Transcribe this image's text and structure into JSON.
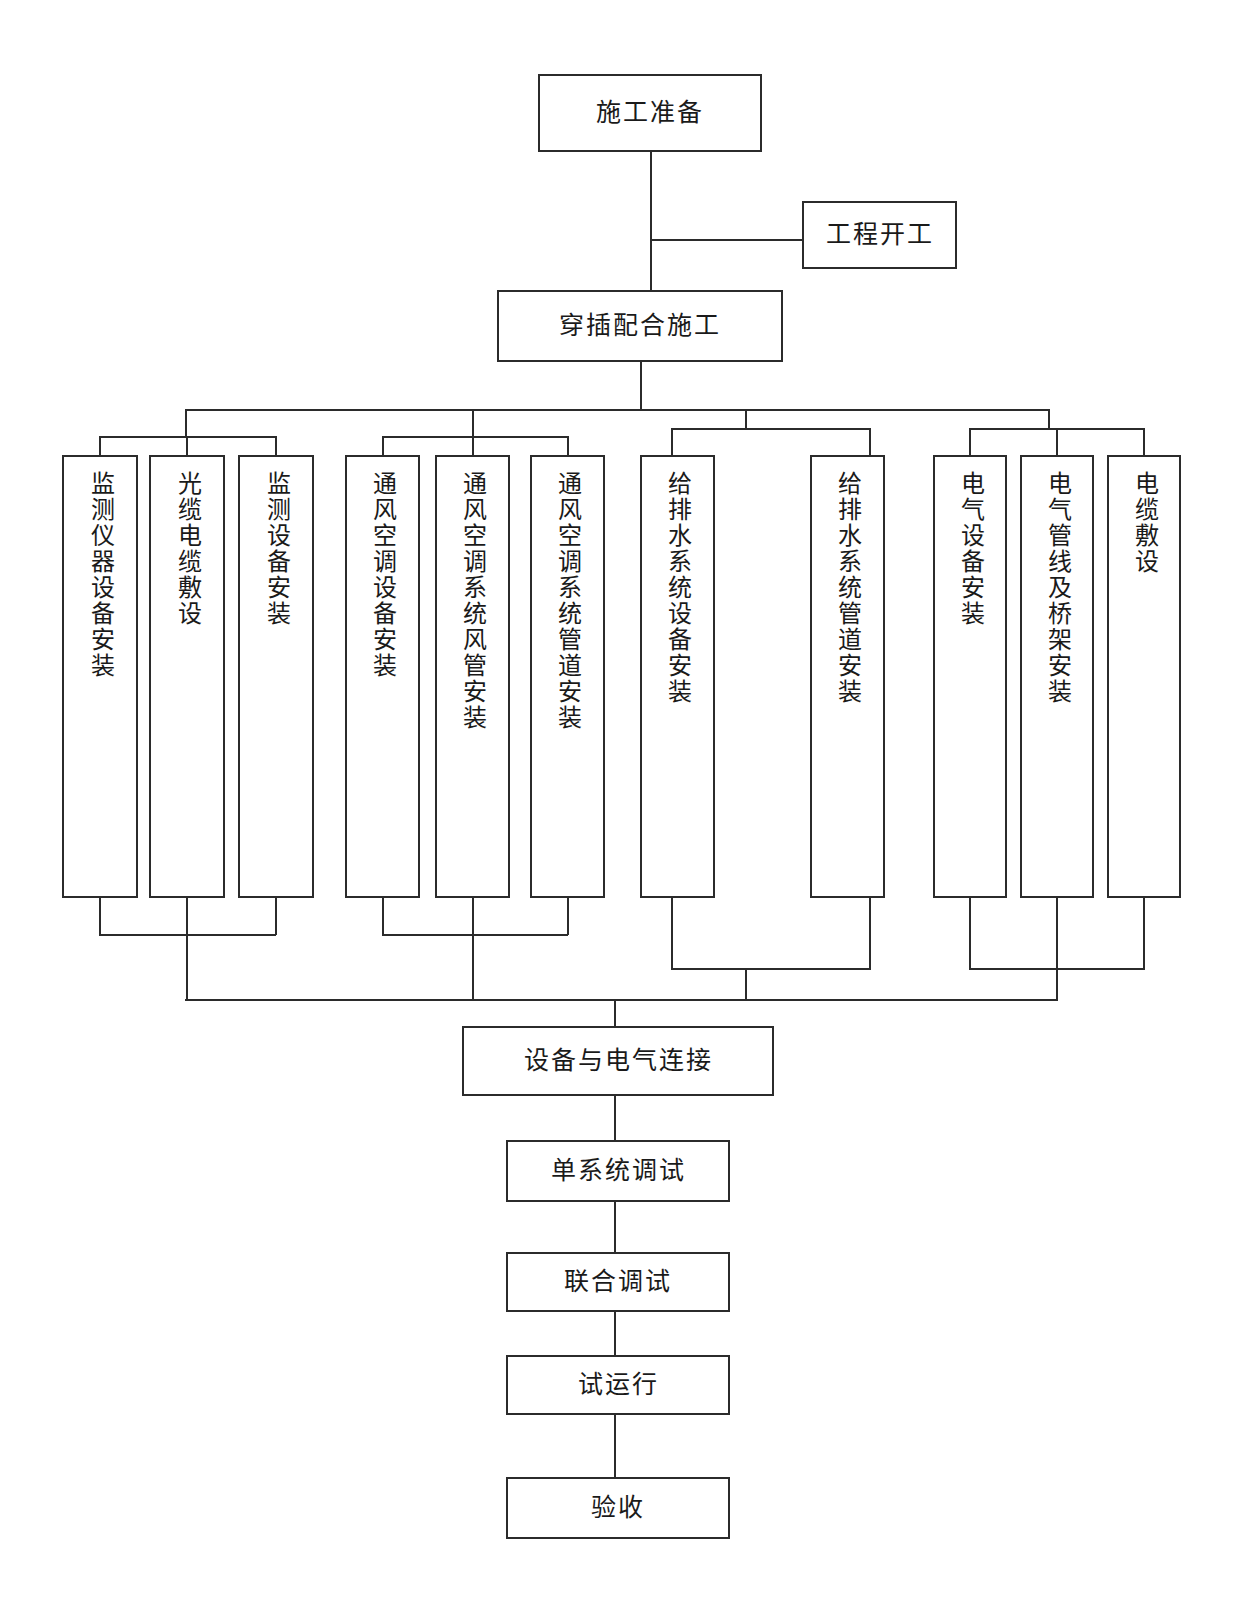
{
  "diagram": {
    "type": "flowchart",
    "orientation": "top-to-bottom",
    "line_color": "#2b2b2b",
    "box_fill": "#ffffff",
    "top": {
      "prep": "施工准备",
      "kickoff": "工程开工",
      "coordinate": "穿插配合施工"
    },
    "groups": [
      {
        "name": "monitoring",
        "tasks": [
          "监测仪器设备安装",
          "光缆电缆敷设",
          "监测设备安装"
        ]
      },
      {
        "name": "hvac",
        "tasks": [
          "通风空调设备安装",
          "通风空调系统风管安装",
          "通风空调系统管道安装"
        ]
      },
      {
        "name": "plumbing",
        "tasks": [
          "给排水系统设备安装",
          "给排水系统管道安装"
        ]
      },
      {
        "name": "electrical",
        "tasks": [
          "电气设备安装",
          "电气管线及桥架安装",
          "电缆敷设"
        ]
      }
    ],
    "bottom": [
      "设备与电气连接",
      "单系统调试",
      "联合调试",
      "试运行",
      "验收"
    ]
  }
}
